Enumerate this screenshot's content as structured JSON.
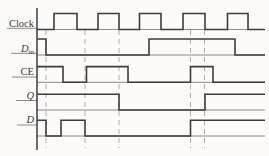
{
  "chart_data": {
    "type": "digital-timing",
    "x_domain_px": [
      37,
      265
    ],
    "signals": [
      {
        "id": "clock",
        "label": "Clock",
        "label_italic": false,
        "label_subscript": "",
        "initial_level": 0,
        "transitions_x": [
          54,
          77,
          98,
          119,
          139.5,
          161,
          183,
          205,
          227.5,
          248
        ]
      },
      {
        "id": "din",
        "label": "D",
        "label_italic": true,
        "label_subscript": "in",
        "initial_level": 1,
        "transitions_x": [
          46,
          149,
          235
        ]
      },
      {
        "id": "ce",
        "label": "CE",
        "label_italic": false,
        "label_subscript": "",
        "initial_level": 1,
        "transitions_x": [
          63,
          86.5,
          128,
          190.5,
          213
        ]
      },
      {
        "id": "q",
        "label": "Q",
        "label_italic": true,
        "label_subscript": "",
        "initial_level": 1,
        "transitions_x": [
          119,
          205
        ]
      },
      {
        "id": "d",
        "label": "D",
        "label_italic": true,
        "label_subscript": "",
        "initial_level": 1,
        "transitions_x": [
          46,
          61,
          85,
          190.5
        ]
      }
    ],
    "dashed_guides_x": [
      46,
      85,
      119,
      190.5,
      204.5
    ]
  },
  "layout": {
    "width": 269,
    "height": 156,
    "axis": {
      "x": 37,
      "y_top": 8,
      "y_bottom": 150
    },
    "x_end": 265,
    "label_right_x": 34,
    "label_font_px": 10.5,
    "subscript_font_px": 7,
    "dashed_y_top": 30,
    "dashed_y_bottom": 148,
    "rows": [
      {
        "base_y": 29.5,
        "high_y": 13.5,
        "label_y": 26.5,
        "underline_y": 28.3,
        "underline_x1": 7
      },
      {
        "base_y": 55,
        "high_y": 39,
        "label_y": 51.5,
        "underline_y": 53.3,
        "underline_x1": 11
      },
      {
        "base_y": 82.3,
        "high_y": 66.6,
        "label_y": 75,
        "underline_y": 77,
        "underline_x1": 12
      },
      {
        "base_y": 110,
        "high_y": 94.3,
        "label_y": 98.5,
        "underline_y": 100.5,
        "underline_x1": 16
      },
      {
        "base_y": 136,
        "high_y": 120.3,
        "label_y": 123,
        "underline_y": 125,
        "underline_x1": 17
      }
    ],
    "colors": {
      "background": "#fcfbf9",
      "waveform": "#3d3d3d",
      "axis": "#3d3d3d",
      "baseline": "#8a8a8a",
      "dashed_guide": "#aeaeae",
      "label_text": "#3b3b3b"
    }
  }
}
